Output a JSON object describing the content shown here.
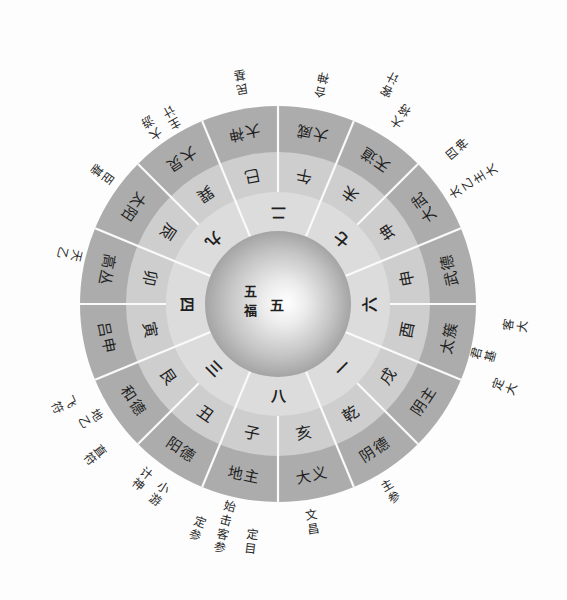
{
  "colors": {
    "background": "#fdfdfd",
    "outer_ring": "#acacac",
    "middle_ring": "#cecece",
    "inner_ring": "#dcdcdc",
    "divider": "#fafafa",
    "text": "#1e1e1e"
  },
  "diagram": {
    "center": {
      "label_vertical": "五福",
      "label_number": "五"
    },
    "inner_ring": [
      "二",
      "七",
      "六",
      "一",
      "八",
      "三",
      "四",
      "九"
    ],
    "middle_ring": [
      "午",
      "未",
      "坤",
      "申",
      "酉",
      "戌",
      "乾",
      "亥",
      "子",
      "丑",
      "艮",
      "寅",
      "卯",
      "辰",
      "巽",
      "巳"
    ],
    "outer_ring": [
      "大威",
      "天道",
      "大武",
      "武德",
      "太簇",
      "阴主",
      "阴德",
      "大义",
      "地主",
      "阳德",
      "和德",
      "吕申",
      "高丛",
      "太阳",
      "大炅",
      "大神"
    ],
    "annotations": [
      "合神",
      "客计",
      "大将",
      "四神",
      "太乙主大",
      "客大",
      "君基",
      "定大",
      "主参",
      "文昌",
      "定目",
      "始击客参",
      "定参",
      "小游",
      "计神",
      "直符",
      "地乙",
      "飞符",
      "天乙",
      "臣基",
      "大游",
      "主计",
      "民基"
    ]
  }
}
